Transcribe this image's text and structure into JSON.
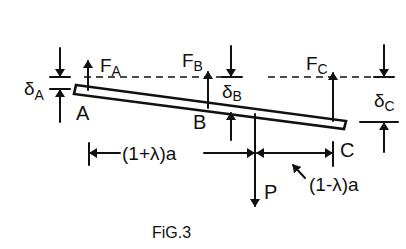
{
  "figure": {
    "caption": "FiG.3",
    "labels": {
      "point_a": "A",
      "point_b": "B",
      "point_c": "C",
      "force_a_main": "F",
      "force_a_sub": "A",
      "force_b_main": "F",
      "force_b_sub": "B",
      "force_c_main": "F",
      "force_c_sub": "C",
      "deflection_a_main": "δ",
      "deflection_a_sub": "A",
      "deflection_b_main": "δ",
      "deflection_b_sub": "B",
      "deflection_c_main": "δ",
      "deflection_c_sub": "C",
      "load": "P",
      "left_span": "(1+λ)a",
      "right_span": "(1-λ)a"
    },
    "colors": {
      "ink": "#111111",
      "background": "#ffffff"
    }
  }
}
